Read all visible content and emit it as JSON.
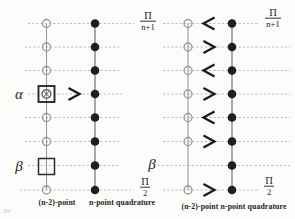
{
  "colors": {
    "background": "#fcfcfb",
    "dash": "#b3b3b0",
    "open_column_line": "#9a9a97",
    "filled_column_line": "#7d7d7a",
    "circle_stroke": "#999996",
    "dot_fill": "#1f1f1d",
    "marker_stroke": "#2a2a28",
    "marker_inner": "#55554f",
    "symbol": "#1c1c1a",
    "text": "#1d1d1b",
    "caption": "#262622",
    "artifact": "#c9c9c4"
  },
  "geometry": {
    "width": 295,
    "height": 219,
    "circle_radius": 4,
    "dot_radius": 4.3,
    "box_size": 16,
    "chevron_half_width": 5.5,
    "chevron_half_height": 6
  },
  "figures": [
    {
      "id": "left",
      "open_column_x": 46.5,
      "filled_column_x": 95,
      "column_top_y": 23.5,
      "column_bottom_y": 190,
      "symbol_x": 74,
      "rows": [
        {
          "y": 23.5,
          "dash": [
            28,
            134
          ],
          "open_marker": "circle",
          "symbol": ""
        },
        {
          "y": 47,
          "dash": [
            25,
            120
          ],
          "open_marker": "circle",
          "symbol": ""
        },
        {
          "y": 70.5,
          "dash": [
            25,
            120
          ],
          "open_marker": "circle",
          "symbol": ""
        },
        {
          "y": 94,
          "dash": [
            28,
            122
          ],
          "open_marker": "boxed-cross-circle",
          "symbol": ">"
        },
        {
          "y": 117.5,
          "dash": [
            25,
            120
          ],
          "open_marker": "circle",
          "symbol": ""
        },
        {
          "y": 141.5,
          "dash": [
            25,
            120
          ],
          "open_marker": "circle",
          "symbol": ""
        },
        {
          "y": 165.5,
          "dash": [
            28,
            120
          ],
          "open_marker": "box",
          "symbol": ""
        },
        {
          "y": 190,
          "dash": [
            20,
            134
          ],
          "open_marker": "circle",
          "symbol": ""
        }
      ],
      "side_labels": [
        {
          "text": "α",
          "x": 19,
          "y": 94
        },
        {
          "text": "β",
          "x": 19,
          "y": 165.5
        }
      ],
      "fraction_labels": [
        {
          "numerator": "Π",
          "denominator": "n+1",
          "x": 148,
          "y": 19
        },
        {
          "numerator": "Π",
          "denominator": "2",
          "x": 145,
          "y": 185
        }
      ],
      "captions": [
        {
          "text": "(n-2)-point",
          "x": 57,
          "y": 205
        },
        {
          "text": "n-point quadrature",
          "x": 122,
          "y": 205
        }
      ]
    },
    {
      "id": "right",
      "open_column_x": 188,
      "filled_column_x": 232,
      "column_top_y": 23.5,
      "column_bottom_y": 190,
      "symbol_x": 209,
      "rows": [
        {
          "y": 23.5,
          "dash": [
            163,
            258
          ],
          "open_marker": "circle",
          "symbol": "<"
        },
        {
          "y": 47,
          "dash": [
            163,
            290
          ],
          "open_marker": "circle",
          "symbol": ">"
        },
        {
          "y": 70.5,
          "dash": [
            163,
            290
          ],
          "open_marker": "circle",
          "symbol": "<"
        },
        {
          "y": 94,
          "dash": [
            163,
            290
          ],
          "open_marker": "circle",
          "symbol": ">"
        },
        {
          "y": 117.5,
          "dash": [
            163,
            290
          ],
          "open_marker": "circle",
          "symbol": "<"
        },
        {
          "y": 141.5,
          "dash": [
            163,
            290
          ],
          "open_marker": "circle",
          "symbol": ">"
        },
        {
          "y": 165.5,
          "dash": [
            158,
            290
          ],
          "open_marker": "none",
          "symbol": ""
        },
        {
          "y": 190,
          "dash": [
            163,
            258
          ],
          "open_marker": "circle",
          "symbol": ">"
        }
      ],
      "side_labels": [
        {
          "text": "β",
          "x": 152,
          "y": 164
        }
      ],
      "fraction_labels": [
        {
          "numerator": "Π",
          "denominator": "n+1",
          "x": 273,
          "y": 16
        },
        {
          "numerator": "Π",
          "denominator": "2",
          "x": 269,
          "y": 184
        }
      ],
      "captions": [
        {
          "text": "(n-2)-point n-point quadrature",
          "x": 234,
          "y": 209
        }
      ]
    }
  ],
  "artifact": {
    "text": "ne",
    "x": 7,
    "y": 213
  }
}
